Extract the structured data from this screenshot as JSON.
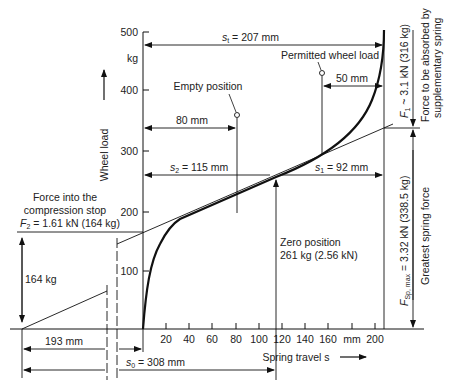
{
  "axes": {
    "y_label": "Wheel load",
    "y_unit": "kg",
    "y_ticks": [
      "500",
      "400",
      "300",
      "200",
      "100"
    ],
    "x_label": "Spring travel s",
    "x_unit": "mm",
    "x_ticks": [
      "20",
      "40",
      "60",
      "80",
      "100",
      "120",
      "140",
      "160",
      "mm",
      "200"
    ]
  },
  "annotations": {
    "st": "s",
    "st_sub": "t",
    "st_value": " = 207 mm",
    "permitted": "Permitted wheel load",
    "empty": "Empty position",
    "d50": "50 mm",
    "d80": "80 mm",
    "s2": "s",
    "s2_sub": "2",
    "s2_value": " = 115 mm",
    "s1": "s",
    "s1_sub": "1",
    "s1_value": " = 92 mm",
    "zero_line1": "Zero position",
    "zero_line2": "261 kg (2.56 kN)",
    "stop_line1": "Force into the",
    "stop_line2": "compression stop",
    "stop_f": "F",
    "stop_f_sub": "2",
    "stop_value": " = 1.61 kN (164 kg)",
    "d164": "164 kg",
    "d193": "193 mm",
    "s0": "s",
    "s0_sub": "0",
    "s0_value": " = 308 mm",
    "f1": "F",
    "f1_sub": "1",
    "f1_value": " ~ 3.1 kN (316 kg)",
    "f1_desc1": "Force to be absorbed by",
    "f1_desc2": "supplementary spring",
    "fsp": "F",
    "fsp_sub": "Sp, max",
    "fsp_value": " = 3.32 kN (338.5 kg)",
    "fsp_desc": "Greatest spring force"
  },
  "colors": {
    "line": "#111111",
    "text": "#222222",
    "background": "#ffffff"
  }
}
